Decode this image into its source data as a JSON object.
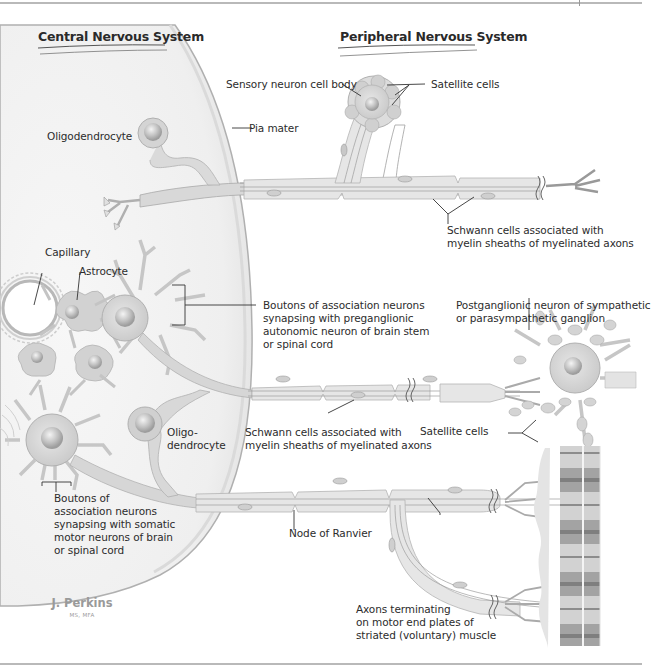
{
  "figure": {
    "headings": {
      "cns": "Central Nervous System",
      "pns": "Peripheral Nervous System"
    },
    "labels": {
      "sensory_body": "Sensory neuron cell body",
      "satellite_top": "Satellite cells",
      "oligodendrocyte_top": "Oligodendrocyte",
      "pia_mater": "Pia mater",
      "schwann_top_1": "Schwann cells associated with",
      "schwann_top_2": "myelin sheaths of myelinated axons",
      "capillary": "Capillary",
      "astrocyte": "Astrocyte",
      "boutons_auto_1": "Boutons of association neurons",
      "boutons_auto_2": "synapsing with preganglionic",
      "boutons_auto_3": "autonomic neuron of brain stem",
      "boutons_auto_4": "or spinal cord",
      "postganglionic_1": "Postganglionic neuron of sympathetic",
      "postganglionic_2": "or parasympathetic ganglion",
      "oligo_mid_1": "Oligo-",
      "oligo_mid_2": "dendrocyte",
      "schwann_mid_1": "Schwann cells associated with",
      "schwann_mid_2": "myelin sheaths of myelinated axons",
      "satellite_mid": "Satellite cells",
      "boutons_somatic_1": "Boutons of",
      "boutons_somatic_2": "association neurons",
      "boutons_somatic_3": "synapsing with somatic",
      "boutons_somatic_4": "motor neurons of brain",
      "boutons_somatic_5": "or spinal cord",
      "node_ranvier": "Node of Ranvier",
      "axons_term_1": "Axons terminating",
      "axons_term_2": "on motor end plates of",
      "axons_term_3": "striated (voluntary) muscle"
    },
    "signature": {
      "name": "J. Perkins",
      "credentials": "MS, MFA"
    },
    "colors": {
      "cns_fill": "#efefef",
      "cell_fill": "#d6d6d6",
      "cell_stroke": "#a8a8a8",
      "axon_fill": "#e4e4e4",
      "muscle_dark": "#9c9c9c",
      "muscle_light": "#cfcfcf",
      "leader": "#333333"
    }
  }
}
